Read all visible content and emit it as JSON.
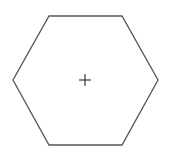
{
  "shape": {
    "type": "hexagon",
    "stroke": "#555555",
    "fill": "#ffffff",
    "points": "49,16 122,16 158,80 122,145 49,145 13,80"
  },
  "center_marker": {
    "type": "cross",
    "stroke": "#333333",
    "cx": 85,
    "cy": 80
  }
}
